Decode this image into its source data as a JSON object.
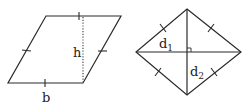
{
  "figures": {
    "parallelogram": {
      "name": "parallelogram",
      "labels": {
        "height": "h",
        "base": "b"
      }
    },
    "rhombus": {
      "name": "rhombus",
      "labels": {
        "diagonal_1": "d",
        "diagonal_1_sub": "1",
        "diagonal_2": "d",
        "diagonal_2_sub": "2"
      }
    }
  },
  "colors": {
    "stroke": "#2a2a2a",
    "background": "#ffffff"
  }
}
